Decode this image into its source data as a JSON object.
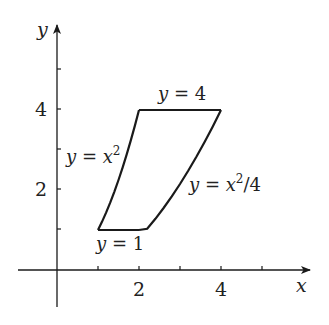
{
  "diagram": {
    "type": "region-plot",
    "axes": {
      "x_label": "x",
      "y_label": "y",
      "x_tick_labels": [
        "2",
        "4"
      ],
      "y_tick_labels": [
        "2",
        "4"
      ],
      "x_ticks": [
        1,
        2,
        3,
        4,
        5
      ],
      "y_ticks": [
        1,
        2,
        3,
        4,
        5
      ]
    },
    "curves": [
      {
        "name": "top",
        "label_var": "y",
        "label_eq": " = 4"
      },
      {
        "name": "left",
        "label_var": "y",
        "label_eq": " = ",
        "label_x": "x",
        "label_sup": "2"
      },
      {
        "name": "right",
        "label_var": "y",
        "label_eq": " = ",
        "label_x": "x",
        "label_sup": "2",
        "label_tail": "/4"
      },
      {
        "name": "bottom",
        "label_var": "y",
        "label_eq": " = 1"
      }
    ],
    "stroke_color": "#1a1a1a"
  }
}
